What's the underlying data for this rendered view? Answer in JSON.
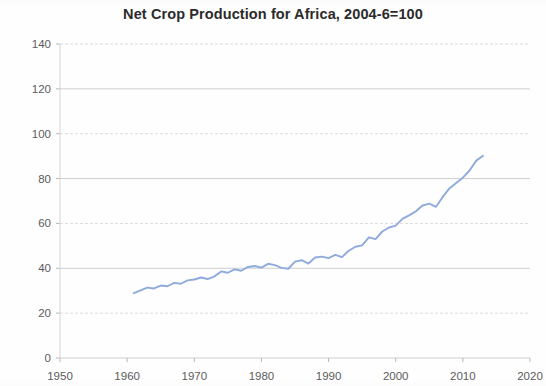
{
  "chart_data": {
    "type": "line",
    "title": "Net Crop Production for Africa, 2004-6=100",
    "xlabel": "",
    "ylabel": "",
    "xlim": [
      1950,
      2020
    ],
    "ylim": [
      0,
      140
    ],
    "grid": true,
    "legend_position": "none",
    "line_color": "#8FAADC",
    "x_ticks": [
      1950,
      1960,
      1970,
      1980,
      1990,
      2000,
      2010,
      2020
    ],
    "y_ticks": [
      0,
      20,
      40,
      60,
      80,
      100,
      120,
      140
    ],
    "x_tick_labels": [
      "1950",
      "1960",
      "1970",
      "1980",
      "1990",
      "2000",
      "2010",
      "2020"
    ],
    "y_tick_labels": [
      "0",
      "20",
      "40",
      "60",
      "80",
      "100",
      "120",
      "140"
    ],
    "series": [
      {
        "name": "Net Crop Production for Africa",
        "x": [
          1961,
          1962,
          1963,
          1964,
          1965,
          1966,
          1967,
          1968,
          1969,
          1970,
          1971,
          1972,
          1973,
          1974,
          1975,
          1976,
          1977,
          1978,
          1979,
          1980,
          1981,
          1982,
          1983,
          1984,
          1985,
          1986,
          1987,
          1988,
          1989,
          1990,
          1991,
          1992,
          1993,
          1994,
          1995,
          1996,
          1997,
          1998,
          1999,
          2000,
          2001,
          2002,
          2003,
          2004,
          2005,
          2006,
          2007,
          2008,
          2009,
          2010,
          2011,
          2012,
          2013
        ],
        "values": [
          28.9,
          30.2,
          31.4,
          31.0,
          32.3,
          32.0,
          33.5,
          33.1,
          34.6,
          35.0,
          35.9,
          35.2,
          36.4,
          38.6,
          38.0,
          39.5,
          38.9,
          40.6,
          41.0,
          40.3,
          42.0,
          41.4,
          40.2,
          39.8,
          43.0,
          43.6,
          42.1,
          44.8,
          45.2,
          44.5,
          46.0,
          45.0,
          47.8,
          49.6,
          50.2,
          53.8,
          53.0,
          56.4,
          58.2,
          59.0,
          62.0,
          63.6,
          65.4,
          68.0,
          68.8,
          67.4,
          71.8,
          75.6,
          78.0,
          80.4,
          83.6,
          88.0,
          90.2
        ]
      }
    ],
    "annotations": []
  },
  "figure": {
    "plot_area": {
      "left_px": 60,
      "right_px": 530,
      "top_px": 44,
      "bottom_px": 358
    }
  }
}
